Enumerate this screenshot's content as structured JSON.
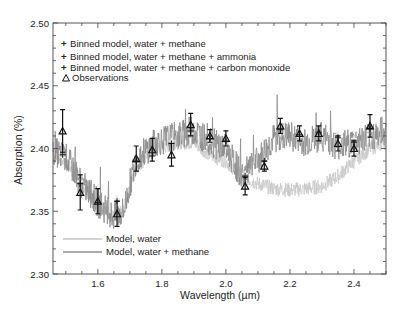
{
  "chart_data": {
    "type": "line",
    "title": "",
    "xlabel": "Wavelength (µm)",
    "ylabel": "Absorption (%)",
    "xlim": [
      1.46,
      2.5
    ],
    "ylim": [
      2.3,
      2.5
    ],
    "x_ticks": [
      1.6,
      1.8,
      2.0,
      2.2,
      2.4
    ],
    "x_tick_labels": [
      "1.6",
      "1.8",
      "2.0",
      "2.2",
      "2.4"
    ],
    "y_ticks": [
      2.3,
      2.35,
      2.4,
      2.45,
      2.5
    ],
    "y_tick_labels": [
      "2.30",
      "2.35",
      "2.40",
      "2.45",
      "2.50"
    ],
    "grid": false,
    "legend_position": "upper-left and lower-left",
    "legend": [
      {
        "label": "Binned model, water + methane",
        "marker": "+",
        "color": "#9a9a9a"
      },
      {
        "label": "Binned model, water + methane + ammonia",
        "marker": "+",
        "color": "#d4d4d4"
      },
      {
        "label": "Binned model, water + methane + carbon monoxide",
        "marker": "+",
        "color": "#222222"
      },
      {
        "label": "Observations",
        "marker": "triangle",
        "color": "#111111"
      },
      {
        "label": "Model, water",
        "marker": "line",
        "color": "#c4c4c4"
      },
      {
        "label": "Model, water + methane",
        "marker": "line",
        "color": "#8c8c8c"
      }
    ],
    "series": [
      {
        "name": "Observations",
        "x": [
          1.49,
          1.545,
          1.6,
          1.66,
          1.72,
          1.77,
          1.83,
          1.89,
          1.95,
          2.0,
          2.06,
          2.12,
          2.17,
          2.23,
          2.29,
          2.35,
          2.4,
          2.45
        ],
        "y": [
          2.414,
          2.365,
          2.358,
          2.348,
          2.392,
          2.399,
          2.395,
          2.419,
          2.41,
          2.408,
          2.37,
          2.386,
          2.418,
          2.412,
          2.412,
          2.404,
          2.4,
          2.418
        ],
        "yerr": [
          0.017,
          0.014,
          0.01,
          0.01,
          0.01,
          0.009,
          0.009,
          0.009,
          0.005,
          0.006,
          0.007,
          0.004,
          0.006,
          0.006,
          0.006,
          0.006,
          0.006,
          0.009
        ]
      },
      {
        "name": "Binned model, water + methane",
        "x": [
          1.49,
          1.545,
          1.6,
          1.66,
          1.72,
          1.77,
          1.83,
          1.89,
          1.95,
          2.0,
          2.06,
          2.12,
          2.17,
          2.23,
          2.29,
          2.35,
          2.4,
          2.45
        ],
        "y": [
          2.393,
          2.374,
          2.357,
          2.36,
          2.388,
          2.392,
          2.406,
          2.412,
          2.406,
          2.404,
          2.378,
          2.39,
          2.41,
          2.405,
          2.407,
          2.408,
          2.405,
          2.413
        ]
      },
      {
        "name": "Binned model, water + methane + ammonia",
        "x": [
          1.49,
          1.545,
          1.6,
          1.66,
          1.72,
          1.77,
          1.83,
          1.89,
          1.95,
          2.0,
          2.06,
          2.12,
          2.17,
          2.23,
          2.29,
          2.35,
          2.4,
          2.45
        ],
        "y": [
          2.393,
          2.374,
          2.357,
          2.36,
          2.388,
          2.392,
          2.406,
          2.412,
          2.406,
          2.404,
          2.38,
          2.388,
          2.412,
          2.409,
          2.41,
          2.411,
          2.408,
          2.414
        ]
      },
      {
        "name": "Binned model, water + methane + carbon monoxide",
        "x": [
          1.49,
          1.545,
          1.6,
          1.66,
          1.72,
          1.77,
          1.83,
          1.89,
          1.95,
          2.0,
          2.06,
          2.12,
          2.17,
          2.23,
          2.29,
          2.35,
          2.4,
          2.45
        ],
        "y": [
          2.395,
          2.372,
          2.357,
          2.358,
          2.39,
          2.394,
          2.404,
          2.414,
          2.408,
          2.406,
          2.378,
          2.39,
          2.415,
          2.411,
          2.413,
          2.409,
          2.405,
          2.416
        ]
      },
      {
        "name": "Model, water",
        "anchors_x": [
          1.46,
          1.5,
          1.55,
          1.6,
          1.65,
          1.68,
          1.72,
          1.78,
          1.85,
          1.9,
          1.95,
          2.0,
          2.05,
          2.1,
          2.15,
          2.2,
          2.25,
          2.3,
          2.35,
          2.4,
          2.45,
          2.5
        ],
        "anchors_y": [
          2.395,
          2.39,
          2.37,
          2.355,
          2.345,
          2.35,
          2.385,
          2.4,
          2.405,
          2.405,
          2.395,
          2.39,
          2.378,
          2.372,
          2.368,
          2.367,
          2.368,
          2.37,
          2.378,
          2.39,
          2.4,
          2.405
        ]
      },
      {
        "name": "Model, water + methane",
        "anchors_x": [
          1.46,
          1.5,
          1.55,
          1.6,
          1.65,
          1.68,
          1.72,
          1.78,
          1.85,
          1.9,
          1.95,
          2.0,
          2.05,
          2.1,
          2.15,
          2.2,
          2.25,
          2.3,
          2.35,
          2.4,
          2.45,
          2.5
        ],
        "anchors_y": [
          2.398,
          2.393,
          2.372,
          2.357,
          2.345,
          2.35,
          2.392,
          2.405,
          2.41,
          2.415,
          2.405,
          2.4,
          2.378,
          2.39,
          2.408,
          2.41,
          2.405,
          2.41,
          2.402,
          2.405,
          2.41,
          2.415
        ]
      }
    ]
  }
}
